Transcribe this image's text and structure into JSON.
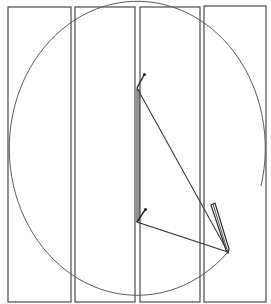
{
  "diagram": {
    "description": "Sketch of an ellipse drawn with two pins, a string loop and a pencil, over four vertical rectangular panels",
    "colors": {
      "background": "#ffffff",
      "lines": "#4a4a4a",
      "curve": "#5a5a5a",
      "string": "#3a3a3a"
    },
    "panels": [
      {
        "id": "panel-1",
        "x": 8,
        "y": 7,
        "width": 63,
        "height": 295
      },
      {
        "id": "panel-2",
        "x": 75,
        "y": 7,
        "width": 60,
        "height": 295
      },
      {
        "id": "panel-3",
        "x": 140,
        "y": 7,
        "width": 60,
        "height": 295
      },
      {
        "id": "panel-4",
        "x": 204,
        "y": 6,
        "width": 62,
        "height": 296
      }
    ],
    "ellipse": {
      "cx": 137,
      "cy": 154,
      "rx": 128,
      "ry": 147,
      "gap_on_right": true
    },
    "pins": [
      {
        "id": "pin-top",
        "base": [
          137,
          88
        ],
        "head": [
          144,
          75
        ]
      },
      {
        "id": "pin-bottom",
        "base": [
          137,
          222
        ],
        "head": [
          145,
          210
        ]
      }
    ],
    "string_triangle": [
      [
        137,
        88
      ],
      [
        228,
        252
      ],
      [
        137,
        222
      ]
    ],
    "pencil": {
      "tip": [
        228,
        252
      ],
      "end": [
        213,
        204
      ]
    }
  }
}
